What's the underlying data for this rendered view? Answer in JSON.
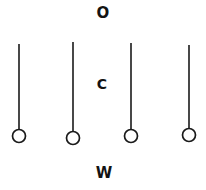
{
  "figure": {
    "title_letters": {
      "top": "O",
      "middle": "C",
      "bottom": "W"
    },
    "canvas": {
      "width": 206,
      "height": 190,
      "background_color": "#ffffff",
      "ink_color": "#1a1a1a"
    },
    "labels": [
      {
        "name": "label-top",
        "text": "O",
        "x": 103,
        "y": 13,
        "font_size": 15
      },
      {
        "name": "label-middle",
        "text": "C",
        "x": 102,
        "y": 84,
        "font_size": 14
      },
      {
        "name": "label-bottom",
        "text": "W",
        "x": 104,
        "y": 173,
        "font_size": 15
      }
    ],
    "pendulums": [
      {
        "name": "pendulum-1",
        "x": 19,
        "top_y": 44,
        "bob_center_y": 136,
        "bob_radius": 6.5,
        "stroke_width": 1.6
      },
      {
        "name": "pendulum-2",
        "x": 73,
        "top_y": 42,
        "bob_center_y": 138,
        "bob_radius": 6.5,
        "stroke_width": 1.6
      },
      {
        "name": "pendulum-3",
        "x": 131,
        "top_y": 43,
        "bob_center_y": 136,
        "bob_radius": 6.5,
        "stroke_width": 1.6
      },
      {
        "name": "pendulum-4",
        "x": 189,
        "top_y": 45,
        "bob_center_y": 135,
        "bob_radius": 6.5,
        "stroke_width": 1.6
      }
    ]
  }
}
